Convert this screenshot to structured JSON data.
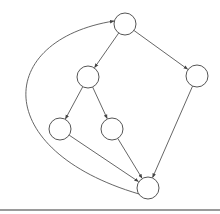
{
  "diagram": {
    "type": "directed-graph",
    "stroke_color": "#555555",
    "node_fill": "#ffffff",
    "node_radius": 11,
    "nodes": [
      {
        "id": "n1",
        "label": "",
        "cx": 125,
        "cy": 24
      },
      {
        "id": "n2",
        "label": "",
        "cx": 88,
        "cy": 77
      },
      {
        "id": "n3",
        "label": "",
        "cx": 197,
        "cy": 76
      },
      {
        "id": "n4",
        "label": "",
        "cx": 60,
        "cy": 129
      },
      {
        "id": "n5",
        "label": "",
        "cx": 112,
        "cy": 129
      },
      {
        "id": "n6",
        "label": "",
        "cx": 148,
        "cy": 188
      }
    ],
    "edges": [
      {
        "from": "n1",
        "to": "n2"
      },
      {
        "from": "n1",
        "to": "n3"
      },
      {
        "from": "n2",
        "to": "n4"
      },
      {
        "from": "n2",
        "to": "n5"
      },
      {
        "from": "n4",
        "to": "n6"
      },
      {
        "from": "n5",
        "to": "n6"
      },
      {
        "from": "n3",
        "to": "n6"
      },
      {
        "from": "n6",
        "to": "n1",
        "curved": true
      }
    ]
  },
  "divider_color": "#9a9a9a"
}
